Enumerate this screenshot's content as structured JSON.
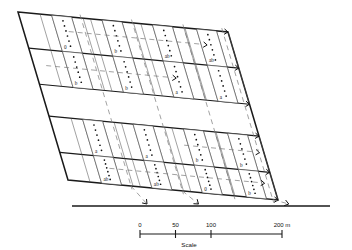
{
  "figure": {
    "title": "",
    "type": "field-plot-layout-diagram",
    "field_shape": "parallelogram",
    "band_count": 4,
    "plots_per_band": 4,
    "bands": [
      {
        "index": 1,
        "plots": [
          {
            "label": "0",
            "dots": 6
          },
          {
            "label": "b",
            "dots": 6
          },
          {
            "label": "ab",
            "dots": 6
          },
          {
            "label": "ab",
            "dots": 6
          }
        ]
      },
      {
        "index": 2,
        "plots": [
          {
            "label": "b",
            "dots": 6
          },
          {
            "label": "b",
            "dots": 6
          },
          {
            "label": "a",
            "dots": 6
          },
          {
            "label": "a",
            "dots": 6
          }
        ]
      },
      {
        "index": 3,
        "plots": [
          {
            "label": "a",
            "dots": 6
          },
          {
            "label": "a",
            "dots": 6
          },
          {
            "label": "b",
            "dots": 6
          },
          {
            "label": "b",
            "dots": 6
          }
        ]
      },
      {
        "index": 4,
        "plots": [
          {
            "label": "ab",
            "dots": 6
          },
          {
            "label": "ab",
            "dots": 6
          },
          {
            "label": "0",
            "dots": 6
          },
          {
            "label": "b",
            "dots": 6
          }
        ]
      }
    ]
  },
  "scale": {
    "caption": "Scale",
    "ticks": [
      {
        "label": "0",
        "value": 0
      },
      {
        "label": "50",
        "value": 50
      },
      {
        "label": "100",
        "value": 100
      },
      {
        "label": "200 m",
        "value": 200
      }
    ],
    "unit": "m",
    "max": 200
  },
  "colors": {
    "ink": "#1a1a1a",
    "strip": "#555555",
    "dashed": "#7a7a7a",
    "background": "#ffffff"
  }
}
